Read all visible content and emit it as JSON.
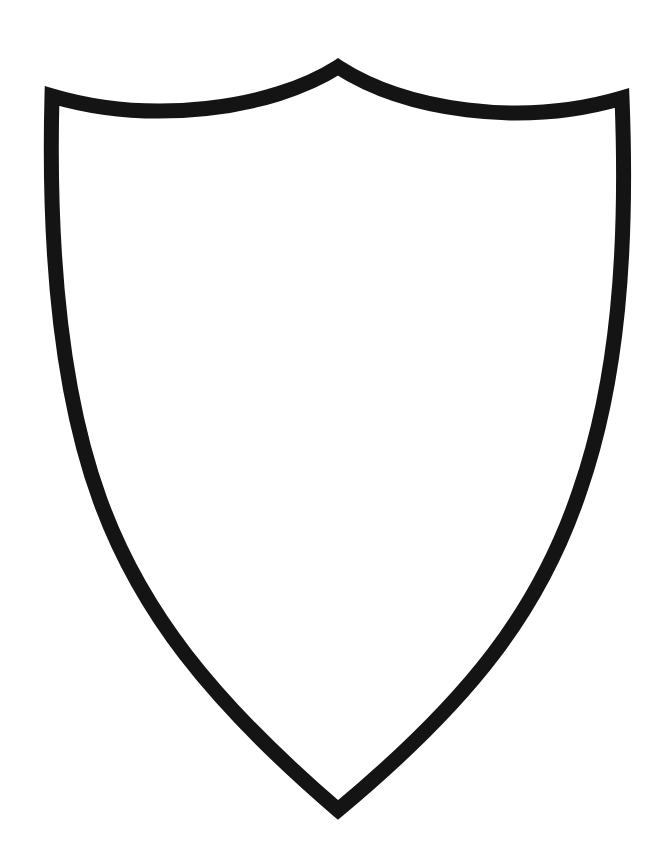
{
  "figure": {
    "stroke_color": "#141414",
    "fill_color": "#ffffff",
    "background": "#ffffff",
    "stroke_width": 15
  }
}
